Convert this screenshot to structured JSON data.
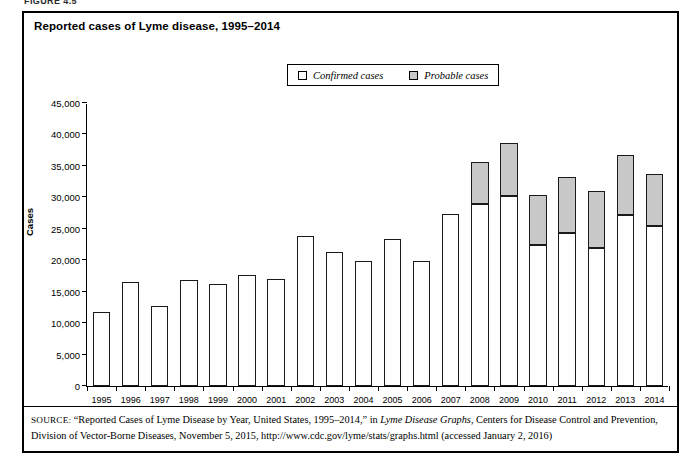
{
  "figure": {
    "label": "FIGURE 4.5",
    "title": "Reported cases of Lyme disease, 1995–2014"
  },
  "legend": {
    "items": [
      {
        "label": "Confirmed cases",
        "swatch": "white-square-icon",
        "color": "#ffffff"
      },
      {
        "label": "Probable cases",
        "swatch": "gray-square-icon",
        "color": "#c8c8c8"
      }
    ]
  },
  "axes": {
    "y_label": "Cases",
    "y_ticks": [
      "0",
      "5,000",
      "10,000",
      "15,000",
      "20,000",
      "25,000",
      "30,000",
      "35,000",
      "40,000",
      "45,000"
    ]
  },
  "source": {
    "prefix": "SOURCE:",
    "text_part1": " “Reported Cases of Lyme Disease by Year, United States, 1995–2014,” in ",
    "italic_title": "Lyme Disease Graphs",
    "text_part2": ", Centers for Disease Control and Prevention, Division of Vector-Borne Diseases, November 5, 2015, http://www.cdc.gov/lyme/stats/graphs.html (accessed January 2, 2016)"
  },
  "chart_data": {
    "type": "bar",
    "stacked": true,
    "title": "Reported cases of Lyme disease, 1995–2014",
    "xlabel": "",
    "ylabel": "Cases",
    "ylim": [
      0,
      45000
    ],
    "ytick_step": 5000,
    "grid": false,
    "legend_position": "top-center",
    "categories": [
      "1995",
      "1996",
      "1997",
      "1998",
      "1999",
      "2000",
      "2001",
      "2002",
      "2003",
      "2004",
      "2005",
      "2006",
      "2007",
      "2008",
      "2009",
      "2010",
      "2011",
      "2012",
      "2013",
      "2014"
    ],
    "series": [
      {
        "name": "Confirmed cases",
        "color": "#ffffff",
        "values": [
          11700,
          16500,
          12800,
          16800,
          16300,
          17700,
          17000,
          23800,
          21300,
          19800,
          23300,
          19900,
          27400,
          28900,
          30200,
          22500,
          24400,
          22000,
          27200,
          25400
        ]
      },
      {
        "name": "Probable cases",
        "color": "#c8c8c8",
        "values": [
          0,
          0,
          0,
          0,
          0,
          0,
          0,
          0,
          0,
          0,
          0,
          0,
          0,
          6700,
          8500,
          7800,
          8800,
          9000,
          9500,
          8300
        ]
      }
    ],
    "totals": [
      11700,
      16500,
      12800,
      16800,
      16300,
      17700,
      17000,
      23800,
      21300,
      19800,
      23300,
      19900,
      27400,
      35600,
      38700,
      30300,
      33200,
      31000,
      36700,
      33700
    ]
  }
}
